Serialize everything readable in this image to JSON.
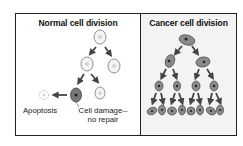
{
  "figure": {
    "left_panel": {
      "title": "Normal cell division",
      "labels": {
        "apoptosis": "Apoptosis",
        "cell_damage_line1": "Cell damage--",
        "cell_damage_line2": "no repair"
      }
    },
    "right_panel": {
      "title": "Cancer cell division"
    },
    "colors": {
      "border": "#222222",
      "normal_cell_fill": "#f4f4f4",
      "normal_cell_stroke": "#777777",
      "damaged_cell_fill": "#777777",
      "cancer_cell_fill": "#8a8a8a",
      "arrow": "#444444",
      "right_panel_bg": "#f3f3f3"
    }
  }
}
